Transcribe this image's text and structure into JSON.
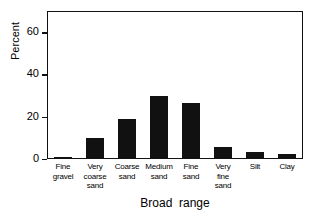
{
  "chart_data": {
    "type": "bar",
    "title": "",
    "xlabel": "Broad  range",
    "ylabel": "Percent",
    "categories": [
      "Fine\ngravel",
      "Very\ncoarse\nsand",
      "Coarse\nsand",
      "Medium\nsand",
      "Fine\nsand",
      "Very\nfine\nsand",
      "Silt",
      "Clay"
    ],
    "values": [
      1,
      10,
      19,
      30,
      26.5,
      5.5,
      3.5,
      2.5
    ],
    "ylim": [
      0,
      70
    ],
    "yticks": [
      0,
      20,
      40,
      60
    ],
    "ytick_labels": [
      "0",
      "20",
      "40",
      "60"
    ],
    "grid": false,
    "legend": "none",
    "bar_color": "#111111"
  },
  "axes": {
    "frame_color": "#111111"
  }
}
